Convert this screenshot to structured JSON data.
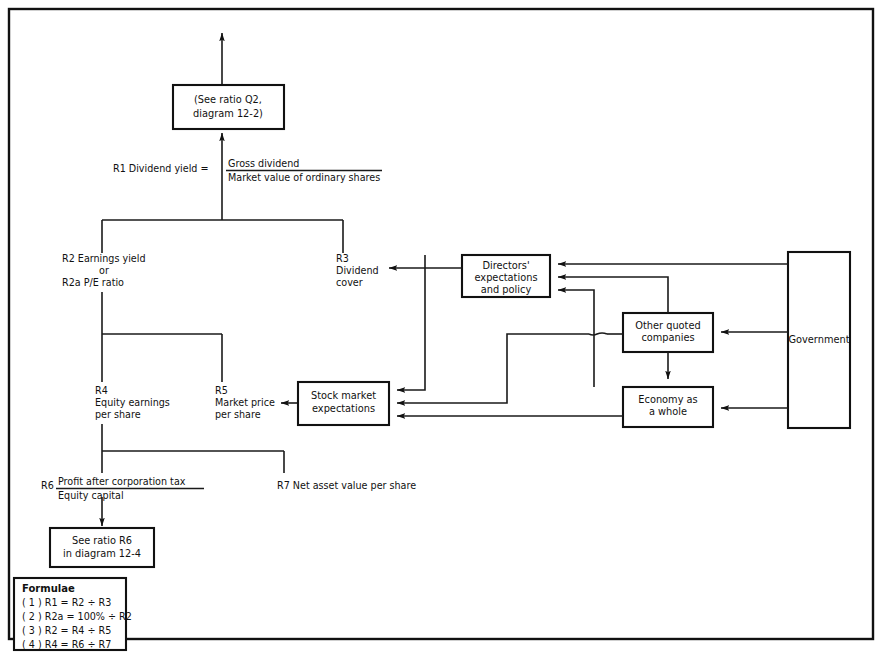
{
  "diagram": {
    "outer_border": true,
    "boxes": [
      {
        "id": "see_q2",
        "lines": [
          "(See ratio Q2,",
          "diagram 12-2)"
        ]
      },
      {
        "id": "directors",
        "lines": [
          "Directors'",
          "expectations",
          "and policy"
        ]
      },
      {
        "id": "other_quoted",
        "lines": [
          "Other quoted",
          "companies"
        ]
      },
      {
        "id": "government",
        "lines": [
          "Government"
        ]
      },
      {
        "id": "economy",
        "lines": [
          "Economy as",
          "a whole"
        ]
      },
      {
        "id": "stock_market",
        "lines": [
          "Stock market",
          "expectations"
        ]
      },
      {
        "id": "see_r6",
        "lines": [
          "See ratio R6",
          "in diagram 12-4"
        ]
      }
    ],
    "labels": {
      "r1_prefix": "R1 Dividend yield =",
      "r1_numerator": "Gross dividend",
      "r1_denominator": "Market value of ordinary shares",
      "r2": [
        "R2 Earnings yield",
        "or",
        "R2a P/E ratio"
      ],
      "r3": [
        "R3",
        "Dividend",
        "cover"
      ],
      "r4": [
        "R4",
        "Equity earnings",
        "per share"
      ],
      "r5": [
        "R5",
        "Market price",
        "per share"
      ],
      "r6_prefix": "R6",
      "r6_numerator": "Profit after corporation tax",
      "r6_denominator": "Equity capital",
      "r7": "R7 Net asset value per share"
    },
    "formulae": {
      "heading": "Formulae",
      "items": [
        "( 1 ) R1 = R2 ÷ R3",
        "( 2 ) R2a = 100% ÷ R2",
        "( 3 ) R2 = R4 ÷ R5",
        "( 4 ) R4 = R6 ÷ R7"
      ]
    }
  }
}
